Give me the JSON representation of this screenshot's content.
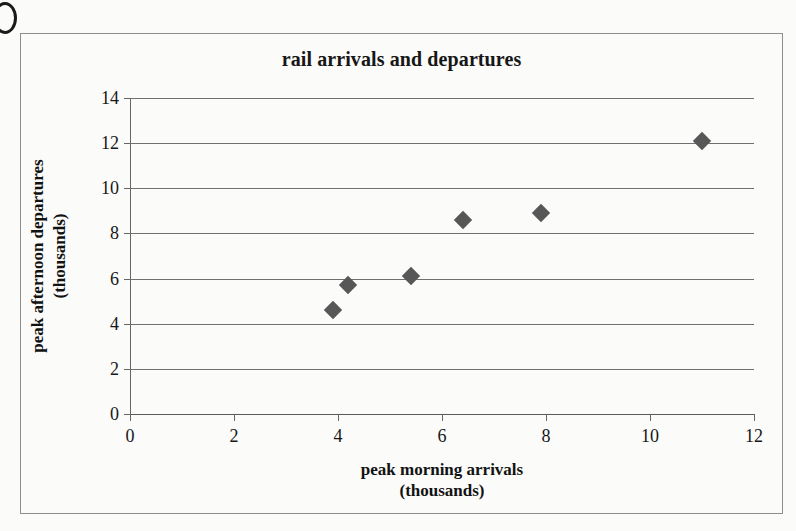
{
  "chart_data": {
    "type": "scatter",
    "title": "rail arrivals and departures",
    "xlabel": "peak morning arrivals (thousands)",
    "ylabel": "peak afternoon departures (thousands)",
    "xlabel_lines": [
      "peak morning arrivals",
      "(thousands)"
    ],
    "ylabel_lines": [
      "peak afternoon departures",
      "(thousands)"
    ],
    "xlim": [
      0,
      12
    ],
    "ylim": [
      0,
      14
    ],
    "xticks": [
      0,
      2,
      4,
      6,
      8,
      10,
      12
    ],
    "yticks": [
      0,
      2,
      4,
      6,
      8,
      10,
      12,
      14
    ],
    "xtick_labels": [
      "0",
      "2",
      "4",
      "6",
      "8",
      "10",
      "12"
    ],
    "ytick_labels": [
      "0",
      "2",
      "4",
      "6",
      "8",
      "10",
      "12",
      "14"
    ],
    "grid": "horizontal",
    "legend": "none",
    "marker": "diamond",
    "marker_color": "#575757",
    "points": [
      {
        "x": 3.9,
        "y": 4.6
      },
      {
        "x": 4.2,
        "y": 5.7
      },
      {
        "x": 5.4,
        "y": 6.1
      },
      {
        "x": 6.4,
        "y": 8.6
      },
      {
        "x": 7.9,
        "y": 8.9
      },
      {
        "x": 11.0,
        "y": 12.1
      }
    ],
    "series": [
      {
        "name": "stations",
        "x": [
          3.9,
          4.2,
          5.4,
          6.4,
          7.9,
          11.0
        ],
        "values": [
          4.6,
          5.7,
          6.1,
          8.6,
          8.9,
          12.1
        ]
      }
    ]
  },
  "colors": {
    "marker": "#575757",
    "gridline": "#6f6f6f",
    "axis": "#5a5a5a",
    "frame": "#8e8e8e",
    "text": "#171717",
    "background": "#fbfbfa"
  }
}
